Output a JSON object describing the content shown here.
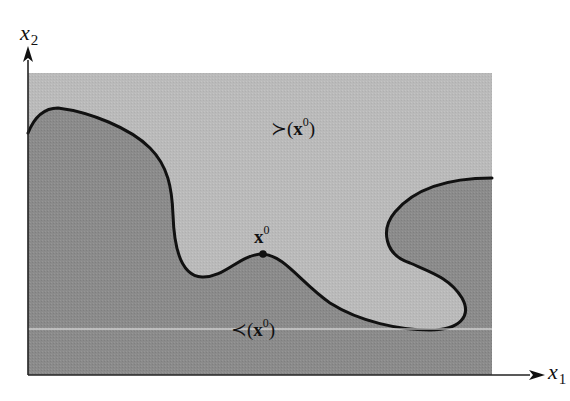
{
  "diagram": {
    "type": "preference-sets",
    "axes": {
      "x": {
        "var": "x",
        "sub": "1"
      },
      "y": {
        "var": "x",
        "sub": "2"
      }
    },
    "point": {
      "name": "x",
      "sup": "0"
    },
    "regions": {
      "upper": {
        "symbol": "≻",
        "open": "(",
        "var": "x",
        "sup": "0",
        "close": ")",
        "color": "#b9b9b9"
      },
      "lower": {
        "symbol": "≺",
        "open": "(",
        "var": "x",
        "sup": "0",
        "close": ")",
        "color": "#8a8a8a"
      }
    },
    "colors": {
      "boundary": "#111111",
      "axis": "#222222",
      "indifference_line": "#f2f2f2"
    }
  }
}
